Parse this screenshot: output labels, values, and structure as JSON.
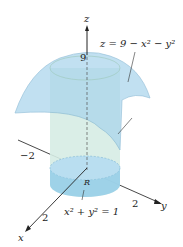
{
  "diagram": {
    "axes": {
      "x": "x",
      "y": "y",
      "z": "z"
    },
    "ticks": {
      "z_top": "9",
      "neg_y": "−2",
      "y": "2",
      "x": "2"
    },
    "region_label": "R",
    "surface_equation": "z = 9 − x² − y²",
    "cylinder_equation": "x² + y² = 1",
    "colors": {
      "surface": "#a8d4ec",
      "cylinder": "#cfe8e0",
      "base": "#7ec4e6",
      "axis": "#222222"
    }
  }
}
